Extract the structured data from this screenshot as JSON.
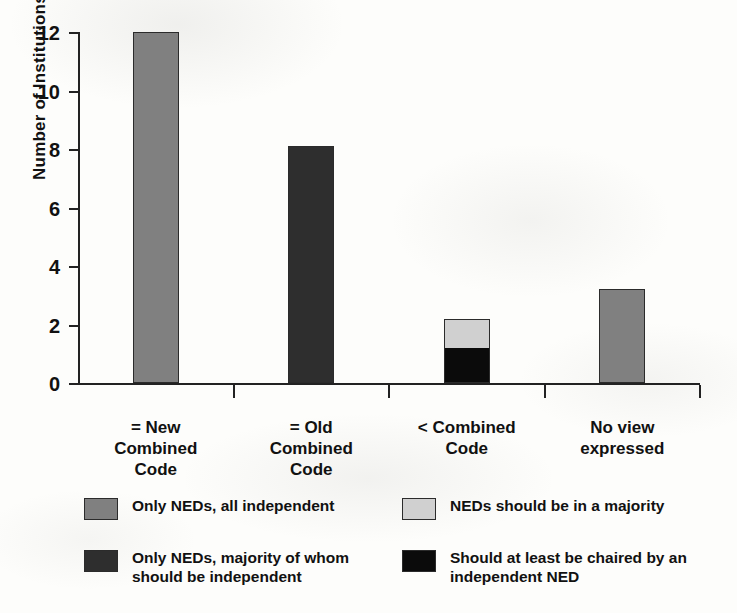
{
  "chart_data": {
    "type": "bar",
    "stacked": true,
    "title": "",
    "xlabel": "",
    "ylabel": "Number of Institutions",
    "ylim": [
      0,
      12
    ],
    "ytick_values": [
      0,
      2,
      4,
      6,
      8,
      10,
      12
    ],
    "ytick_labels": [
      "0",
      "2",
      "4",
      "6",
      "8",
      "10",
      "12"
    ],
    "grid": false,
    "legend_position": "bottom",
    "categories": [
      "= New\nCombined\nCode",
      "= Old\nCombined\nCode",
      "< Combined\nCode",
      "No view\nexpressed"
    ],
    "category_lines": [
      [
        "= New",
        "Combined",
        "Code"
      ],
      [
        "= Old",
        "Combined",
        "Code"
      ],
      [
        "< Combined",
        "Code"
      ],
      [
        "No view",
        "expressed"
      ]
    ],
    "series": [
      {
        "name": "Only NEDs, all independent",
        "color": "#808080",
        "values": [
          12.0,
          0,
          0,
          3.2
        ]
      },
      {
        "name": "Only NEDs, majority of whom should be independent",
        "color": "#2e2e2e",
        "values": [
          0,
          8.1,
          0,
          0
        ]
      },
      {
        "name": "Should at least be chaired by an independent NED",
        "color": "#0b0b0b",
        "values": [
          0,
          0,
          1.2,
          0
        ]
      },
      {
        "name": "NEDs should be in a majority",
        "color": "#d0d0d0",
        "values": [
          0,
          0,
          1.0,
          0
        ]
      }
    ],
    "bar_totals": [
      12.0,
      8.1,
      2.2,
      3.2
    ]
  },
  "axis": {
    "y_title": "Number of Institutions",
    "ticks": [
      {
        "label": "12",
        "value": 12
      },
      {
        "label": "10",
        "value": 10
      },
      {
        "label": "8",
        "value": 8
      },
      {
        "label": "6",
        "value": 6
      },
      {
        "label": "4",
        "value": 4
      },
      {
        "label": "2",
        "value": 2
      },
      {
        "label": "0",
        "value": 0
      }
    ]
  },
  "categories": [
    {
      "line1": "= New",
      "line2": "Combined",
      "line3": "Code"
    },
    {
      "line1": "= Old",
      "line2": "Combined",
      "line3": "Code"
    },
    {
      "line1": "< Combined",
      "line2": "Code",
      "line3": ""
    },
    {
      "line1": "No view",
      "line2": "expressed",
      "line3": ""
    }
  ],
  "legend": {
    "items": [
      {
        "label": "Only NEDs, all independent",
        "color": "#808080"
      },
      {
        "label": "NEDs should be in a majority",
        "color": "#d0d0d0"
      },
      {
        "label": "Only NEDs, majority of whom should be independent",
        "color": "#2e2e2e"
      },
      {
        "label": "Should at least be chaired by an independent NED",
        "color": "#0b0b0b"
      }
    ]
  }
}
